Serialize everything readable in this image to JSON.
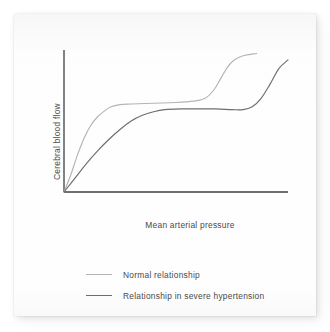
{
  "chart_data": {
    "type": "line",
    "title": "",
    "subtitle": "",
    "xlabel": "Mean arterial pressure",
    "ylabel": "Cerebral blood flow",
    "xlim": [
      0,
      100
    ],
    "ylim": [
      0,
      100
    ],
    "grid": false,
    "x_ticks": [],
    "y_ticks": [],
    "legend_position": "bottom",
    "axis_color": "#3f3f3f",
    "series": [
      {
        "name": "Normal relationship",
        "color": "#b4b4b4",
        "comment": "Cerebral autoregulation curve in normotensive subject: steep rise, early plateau, breakthrough at lower pressure",
        "points": [
          [
            0,
            0
          ],
          [
            3,
            12
          ],
          [
            6,
            26
          ],
          [
            9,
            38
          ],
          [
            12,
            47
          ],
          [
            15,
            53
          ],
          [
            18,
            57
          ],
          [
            21,
            60
          ],
          [
            25,
            61.5
          ],
          [
            30,
            62
          ],
          [
            40,
            62.5
          ],
          [
            50,
            63
          ],
          [
            58,
            64
          ],
          [
            63,
            66
          ],
          [
            67,
            72
          ],
          [
            70,
            80
          ],
          [
            73,
            88
          ],
          [
            76,
            93
          ],
          [
            80,
            96
          ],
          [
            86,
            97.5
          ]
        ]
      },
      {
        "name": "Relationship in severe hypertension",
        "color": "#6e6e6e",
        "comment": "Autoregulation curve shifted right in chronic severe hypertension: slower rise, later plateau, delayed breakthrough",
        "points": [
          [
            0,
            0
          ],
          [
            5,
            10
          ],
          [
            10,
            20
          ],
          [
            15,
            29
          ],
          [
            20,
            37
          ],
          [
            25,
            44
          ],
          [
            30,
            50
          ],
          [
            35,
            54
          ],
          [
            40,
            56.5
          ],
          [
            45,
            58
          ],
          [
            52,
            58.5
          ],
          [
            60,
            58.5
          ],
          [
            68,
            58.5
          ],
          [
            75,
            58
          ],
          [
            80,
            58
          ],
          [
            84,
            60
          ],
          [
            88,
            66
          ],
          [
            92,
            76
          ],
          [
            96,
            87
          ],
          [
            100,
            93
          ]
        ]
      }
    ]
  },
  "legend": {
    "entries": [
      {
        "label": "Normal relationship",
        "color": "#b4b4b4"
      },
      {
        "label": "Relationship in severe hypertension",
        "color": "#6e6e6e"
      }
    ]
  }
}
